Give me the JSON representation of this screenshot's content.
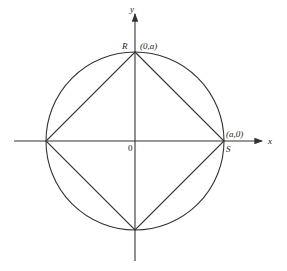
{
  "diagram": {
    "axes": {
      "x_label": "x",
      "y_label": "y",
      "origin_label": "0"
    },
    "points": {
      "R": {
        "name": "R",
        "coords": "(0,a)"
      },
      "S": {
        "name": "S",
        "coords": "(a,0)"
      }
    },
    "colors": {
      "stroke": "#333333",
      "background": "#ffffff"
    }
  }
}
